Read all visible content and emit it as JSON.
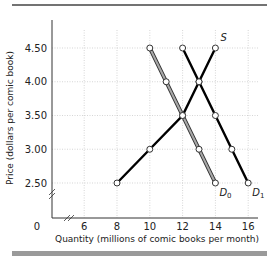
{
  "chart_data": {
    "type": "line",
    "title": "",
    "xlabel": "Quantity (millions of comic books per month)",
    "ylabel": "Price (dollars per comic book)",
    "x_ticks": [
      "0",
      "6",
      "8",
      "10",
      "12",
      "14",
      "16"
    ],
    "y_ticks": [
      "2.50",
      "3.00",
      "3.50",
      "4.00",
      "4.50"
    ],
    "xlim": [
      6,
      16
    ],
    "ylim": [
      2.5,
      4.5
    ],
    "grid": true,
    "axis_breaks": [
      "x",
      "y"
    ],
    "series": [
      {
        "name": "S",
        "label": "S",
        "color": "#000000",
        "points": [
          [
            8,
            2.5
          ],
          [
            10,
            3.0
          ],
          [
            12,
            3.5
          ],
          [
            13,
            4.0
          ],
          [
            14,
            4.5
          ]
        ]
      },
      {
        "name": "D0",
        "label": "D",
        "sub": "0",
        "color": "#8c8c8c",
        "points": [
          [
            10,
            4.5
          ],
          [
            11,
            4.0
          ],
          [
            12,
            3.5
          ],
          [
            13,
            3.0
          ],
          [
            14,
            2.5
          ]
        ]
      },
      {
        "name": "D1",
        "label": "D",
        "sub": "1",
        "color": "#000000",
        "points": [
          [
            12,
            4.5
          ],
          [
            13,
            4.0
          ],
          [
            14,
            3.5
          ],
          [
            15,
            3.0
          ],
          [
            16,
            2.5
          ]
        ]
      }
    ]
  },
  "labels": {
    "x_axis": "Quantity (millions of comic books per month)",
    "y_axis": "Price (dollars per comic book)",
    "origin": "0"
  }
}
